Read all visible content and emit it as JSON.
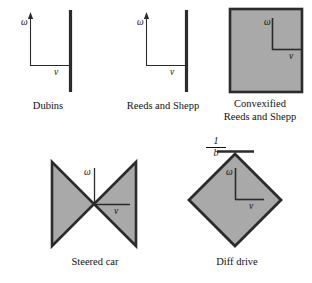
{
  "figure": {
    "caption_type": "control-set-diagrams",
    "fill_color": "#a9a9a9",
    "stroke_color": "#2b2b2b",
    "background_color": "#ffffff",
    "panels": [
      {
        "id": "dubins",
        "label": "Dubins",
        "shape": "vertical-segment",
        "omega_label": "ω",
        "v_label": "v",
        "description": "Single vertical thick line segment in the omega-v plane"
      },
      {
        "id": "reeds-and-shepp",
        "label": "Reeds and Shepp",
        "shape": "vertical-segment",
        "omega_label": "ω",
        "v_label": "v",
        "description": "Single vertical thick line segment in the omega-v plane"
      },
      {
        "id": "convexified-reeds-and-shepp",
        "label": "Convexified\nReeds and Shepp",
        "shape": "square",
        "omega_label": "ω",
        "v_label": "v",
        "description": "Filled square region in the omega-v plane"
      },
      {
        "id": "steered-car",
        "label": "Steered car",
        "shape": "bowtie",
        "omega_label": "ω",
        "v_label": "v",
        "description": "Two opposing filled triangles meeting at the origin"
      },
      {
        "id": "diff-drive",
        "label": "Diff drive",
        "shape": "diamond",
        "omega_label": "ω",
        "v_label": "v",
        "tick_label_numerator": "1",
        "tick_label_denominator": "b",
        "description": "Filled rhombus region in the omega-v plane with 1/b marked on the omega axis"
      }
    ]
  }
}
